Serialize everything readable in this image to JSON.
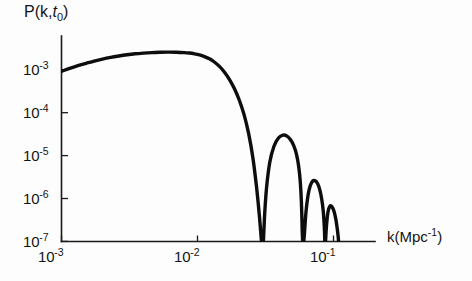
{
  "chart_data": {
    "type": "line",
    "title": "",
    "ylabel": "P(k,t0)",
    "ylabel_parts": {
      "prefix": "P(k,",
      "italic": "t",
      "subscript": "0",
      "suffix": ")"
    },
    "xlabel": "k(Mpc-1)",
    "xlabel_parts": {
      "prefix": "k(Mpc",
      "superscript": "-1",
      "suffix": ")"
    },
    "xscale": "log",
    "yscale": "log",
    "xlim": [
      0.001,
      0.16
    ],
    "ylim": [
      1e-07,
      0.0035
    ],
    "grid": false,
    "legend": null,
    "x_ticks": [
      {
        "value": 0.001,
        "mantissa": "10",
        "exponent": "-3",
        "label": "10-3"
      },
      {
        "value": 0.01,
        "mantissa": "10",
        "exponent": "-2",
        "label": "10-2"
      },
      {
        "value": 0.1,
        "mantissa": "10",
        "exponent": "-1",
        "label": "10-1"
      }
    ],
    "y_ticks": [
      {
        "value": 0.001,
        "mantissa": "10",
        "exponent": "-3",
        "label": "10-3"
      },
      {
        "value": 0.0001,
        "mantissa": "10",
        "exponent": "-4",
        "label": "10-4"
      },
      {
        "value": 1e-05,
        "mantissa": "10",
        "exponent": "-5",
        "label": "10-5"
      },
      {
        "value": 1e-06,
        "mantissa": "10",
        "exponent": "-6",
        "label": "10-6"
      },
      {
        "value": 1e-07,
        "mantissa": "10",
        "exponent": "-7",
        "label": "10-7"
      }
    ],
    "series": [
      {
        "name": "P(k,t0)",
        "color": "#0d0d0d",
        "x": [
          0.001,
          0.00115,
          0.00132,
          0.00152,
          0.00174,
          0.002,
          0.0023,
          0.00264,
          0.00303,
          0.00348,
          0.004,
          0.0046,
          0.00528,
          0.00606,
          0.00696,
          0.008,
          0.0087,
          0.0095,
          0.01035,
          0.01125,
          0.01225,
          0.0133,
          0.0145,
          0.0158,
          0.0172,
          0.0187,
          0.0203,
          0.022,
          0.0238,
          0.0256,
          0.0272,
          0.0285,
          0.0294,
          0.0299,
          0.0302,
          0.0306,
          0.0312,
          0.0322,
          0.034,
          0.0365,
          0.0395,
          0.0425,
          0.0455,
          0.0485,
          0.051,
          0.0535,
          0.0555,
          0.057,
          0.058,
          0.0585,
          0.059,
          0.0598,
          0.061,
          0.063,
          0.066,
          0.0695,
          0.073,
          0.0765,
          0.0795,
          0.082,
          0.084,
          0.0852,
          0.086,
          0.0866,
          0.0874,
          0.0888,
          0.091,
          0.094,
          0.0975,
          0.101,
          0.104,
          0.1065,
          0.1082,
          0.1093,
          0.11,
          0.1106,
          0.1115
        ],
        "y": [
          0.00092,
          0.00108,
          0.00125,
          0.00142,
          0.0016,
          0.00178,
          0.00195,
          0.0021,
          0.00224,
          0.00236,
          0.00245,
          0.00252,
          0.00256,
          0.00258,
          0.00257,
          0.00252,
          0.00246,
          0.00236,
          0.00222,
          0.00203,
          0.0018,
          0.00152,
          0.0012,
          0.00088,
          0.00059,
          0.00036,
          0.000195,
          9e-05,
          3.2e-05,
          8.5e-06,
          1.8e-06,
          4e-07,
          1.2e-07,
          5e-08,
          5e-08,
          1.2e-07,
          4.5e-07,
          1.8e-06,
          7e-06,
          1.65e-05,
          2.6e-05,
          3e-05,
          2.85e-05,
          2.3e-05,
          1.7e-05,
          1.05e-05,
          5.5e-06,
          2.4e-06,
          9e-07,
          4e-07,
          1.5e-07,
          5e-08,
          1.4e-07,
          5.5e-07,
          1.55e-06,
          2.45e-06,
          2.6e-06,
          2.2e-06,
          1.55e-06,
          9.5e-07,
          5.2e-07,
          2.8e-07,
          1.5e-07,
          7e-08,
          1e-07,
          2.3e-07,
          4.8e-07,
          6.6e-07,
          6.4e-07,
          5e-07,
          3.3e-07,
          2e-07,
          1.3e-07,
          9e-08,
          7e-08,
          6e-08,
          5e-08
        ]
      }
    ],
    "features": {
      "broad_peak_k": 0.006,
      "broad_peak_value": 0.00258,
      "nulls_k": [
        0.03,
        0.059,
        0.0866
      ],
      "oscillation_peaks": [
        {
          "k": 0.0413,
          "value": 3e-05
        },
        {
          "k": 0.07,
          "value": 2.6e-06
        },
        {
          "k": 0.0975,
          "value": 6.6e-07
        }
      ]
    }
  }
}
